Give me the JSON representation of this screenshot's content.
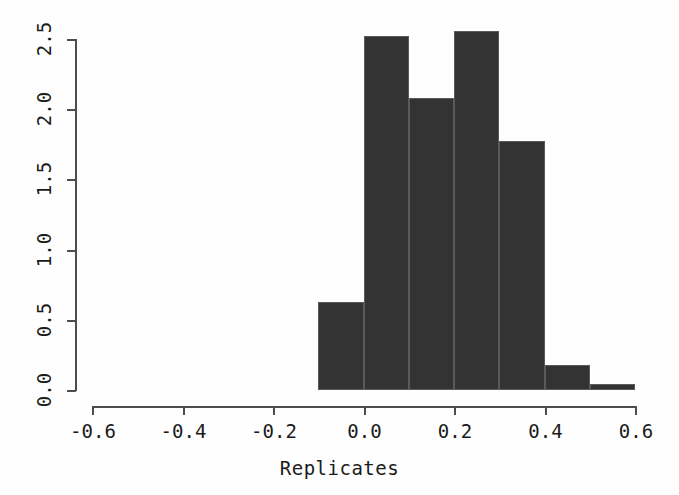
{
  "chart_data": {
    "type": "bar",
    "title": "",
    "subtitle": "",
    "xlabel": "Replicates",
    "ylabel": "",
    "xlim": [
      -0.6,
      0.6
    ],
    "ylim": [
      0.0,
      2.6
    ],
    "grid": false,
    "legend": null,
    "bin_width": 0.1,
    "bin_edges": [
      -0.1,
      0.0,
      0.1,
      0.2,
      0.3,
      0.4,
      0.5,
      0.6
    ],
    "categories": [
      "-0.1 to 0.0",
      "0.0 to 0.1",
      "0.1 to 0.2",
      "0.2 to 0.3",
      "0.3 to 0.4",
      "0.4 to 0.5",
      "0.5 to 0.6"
    ],
    "values": [
      0.63,
      2.52,
      2.08,
      2.56,
      1.77,
      0.18,
      0.04
    ],
    "bar_color": "#333333",
    "bar_border_color": "#5a5a5a",
    "xticks": [
      {
        "value": -0.6,
        "label": "-0.6"
      },
      {
        "value": -0.4,
        "label": "-0.4"
      },
      {
        "value": -0.2,
        "label": "-0.2"
      },
      {
        "value": 0.0,
        "label": "0.0"
      },
      {
        "value": 0.2,
        "label": "0.2"
      },
      {
        "value": 0.4,
        "label": "0.4"
      },
      {
        "value": 0.6,
        "label": "0.6"
      }
    ],
    "yticks": [
      {
        "value": 0.0,
        "label": "0.0"
      },
      {
        "value": 0.5,
        "label": "0.5"
      },
      {
        "value": 1.0,
        "label": "1.0"
      },
      {
        "value": 1.5,
        "label": "1.5"
      },
      {
        "value": 2.0,
        "label": "2.0"
      },
      {
        "value": 2.5,
        "label": "2.5"
      }
    ]
  },
  "axes": {
    "x_axis_label": "Replicates",
    "axis_color": "#4d4d4d",
    "background": "#ffffff"
  }
}
